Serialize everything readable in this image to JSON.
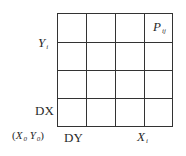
{
  "diagram": {
    "type": "grid",
    "rows": 4,
    "cols": 4,
    "line_color": "#333333",
    "background": "#ffffff"
  },
  "labels": {
    "y_axis_var": "Y",
    "y_axis_sub": "i",
    "cell_label": "P",
    "cell_label_sub": "ij",
    "dx": "DX",
    "dy": "DY",
    "origin_open": "(",
    "origin_x": "X",
    "origin_x_sub": "0",
    "origin_y": "Y",
    "origin_y_sub": "0",
    "origin_close": ")",
    "x_axis_var": "X",
    "x_axis_sub": "i"
  }
}
